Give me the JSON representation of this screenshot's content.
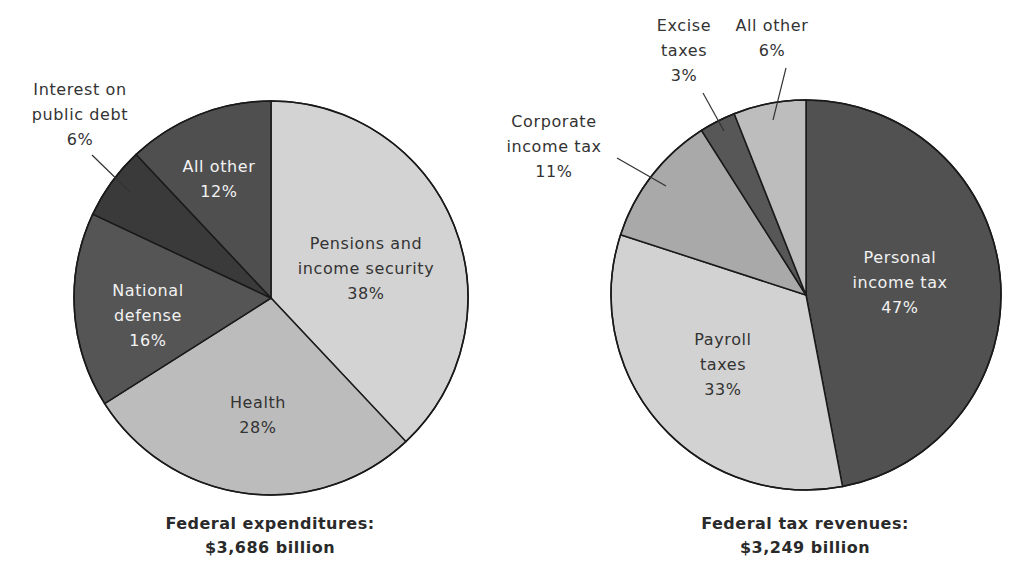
{
  "chart_data": [
    {
      "type": "pie",
      "title": "Federal expenditures:",
      "subtitle": "$3,686 billion",
      "center": [
        271,
        298
      ],
      "radius": 197,
      "start_angle_deg": 0,
      "slices": [
        {
          "label": "Pensions and income security",
          "value": 38,
          "color": "#d3d3d3",
          "text_color": "#333333",
          "label_lines": [
            "Pensions and",
            "income security",
            "38%"
          ],
          "label_pos": [
            366,
            249
          ],
          "inside": true
        },
        {
          "label": "Health",
          "value": 28,
          "color": "#bcbcbc",
          "text_color": "#333333",
          "label_lines": [
            "Health",
            "28%"
          ],
          "label_pos": [
            258,
            408
          ],
          "inside": true
        },
        {
          "label": "National defense",
          "value": 16,
          "color": "#555555",
          "text_color": "#f2f2f2",
          "label_lines": [
            "National",
            "defense",
            "16%"
          ],
          "label_pos": [
            148,
            296
          ],
          "inside": true
        },
        {
          "label": "Interest on public debt",
          "value": 6,
          "color": "#3a3a3a",
          "text_color": "#333333",
          "label_lines": [
            "Interest on",
            "public debt",
            "6%"
          ],
          "label_pos": [
            80,
            95
          ],
          "inside": false,
          "leader": [
            [
              92,
              155
            ],
            [
              130,
              192
            ]
          ]
        },
        {
          "label": "All other",
          "value": 12,
          "color": "#4f4f4f",
          "text_color": "#f2f2f2",
          "label_lines": [
            "All other",
            "12%"
          ],
          "label_pos": [
            219,
            172
          ],
          "inside": true
        }
      ]
    },
    {
      "type": "pie",
      "title": "Federal tax revenues:",
      "subtitle": "$3,249 billion",
      "center": [
        806,
        295
      ],
      "radius": 195,
      "start_angle_deg": 0,
      "slices": [
        {
          "label": "Personal income tax",
          "value": 47,
          "color": "#515151",
          "text_color": "#f2f2f2",
          "label_lines": [
            "Personal",
            "income tax",
            "47%"
          ],
          "label_pos": [
            900,
            263
          ],
          "inside": true
        },
        {
          "label": "Payroll taxes",
          "value": 33,
          "color": "#d2d2d2",
          "text_color": "#333333",
          "label_lines": [
            "Payroll",
            "taxes",
            "33%"
          ],
          "label_pos": [
            723,
            345
          ],
          "inside": true
        },
        {
          "label": "Corporate income tax",
          "value": 11,
          "color": "#a9a9a9",
          "text_color": "#333333",
          "label_lines": [
            "Corporate",
            "income tax",
            "11%"
          ],
          "label_pos": [
            554,
            127
          ],
          "inside": false,
          "leader": [
            [
              617,
              158
            ],
            [
              666,
              186
            ]
          ]
        },
        {
          "label": "Excise taxes",
          "value": 3,
          "color": "#575757",
          "text_color": "#333333",
          "label_lines": [
            "Excise",
            "taxes",
            "3%"
          ],
          "label_pos": [
            684,
            31
          ],
          "inside": false,
          "leader": [
            [
              703,
              93
            ],
            [
              724,
              131
            ]
          ]
        },
        {
          "label": "All other",
          "value": 6,
          "color": "#bdbdbd",
          "text_color": "#333333",
          "label_lines": [
            "All other",
            "6%"
          ],
          "label_pos": [
            772,
            31
          ],
          "inside": false,
          "leader": [
            [
              786,
              68
            ],
            [
              773,
              120
            ]
          ]
        }
      ]
    }
  ],
  "captions": [
    {
      "title": "Federal expenditures:",
      "amount": "$3,686 billion"
    },
    {
      "title": "Federal tax revenues:",
      "amount": "$3,249 billion"
    }
  ]
}
